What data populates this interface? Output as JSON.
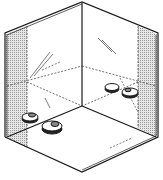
{
  "figure": {
    "colors": {
      "stroke": "#1a1a1a",
      "panel_shade": "#cfcfcf",
      "background": "#ffffff"
    },
    "objects": [
      {
        "type": "disc",
        "label": "left-front-disc-1"
      },
      {
        "type": "disc",
        "label": "left-front-disc-2"
      },
      {
        "type": "disc",
        "label": "right-back-disc-1"
      },
      {
        "type": "disc",
        "label": "right-back-disc-2"
      }
    ]
  }
}
